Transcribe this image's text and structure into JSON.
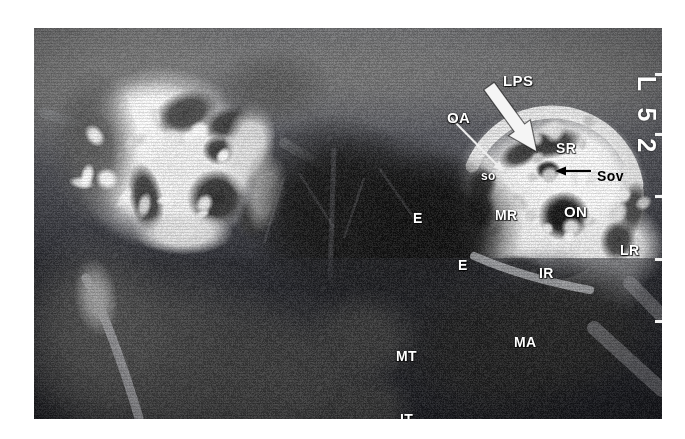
{
  "figure": {
    "modality": "MRI",
    "view": "coronal",
    "region": "orbits",
    "plate_left": 34,
    "plate_top": 28,
    "plate_width": 628,
    "plate_height": 391,
    "background": "#ffffff",
    "film_base_color": "#55565a"
  },
  "orientation_marker": {
    "text": "L 5 2",
    "rotation_deg": 90,
    "color": "#ffffff"
  },
  "edge_ticks": [
    {
      "y": 45
    },
    {
      "y": 105
    },
    {
      "y": 167
    },
    {
      "y": 230
    },
    {
      "y": 292
    }
  ],
  "labels": [
    {
      "id": "lps",
      "text": "LPS",
      "x": 469,
      "y": 45,
      "size": "lg",
      "tone": "light"
    },
    {
      "id": "oa",
      "text": "OA",
      "x": 413,
      "y": 82,
      "size": "lg",
      "tone": "light"
    },
    {
      "id": "so",
      "text": "so",
      "x": 447,
      "y": 142,
      "size": "sm",
      "tone": "light"
    },
    {
      "id": "sr",
      "text": "SR",
      "x": 522,
      "y": 113,
      "size": "md",
      "tone": "light"
    },
    {
      "id": "sov",
      "text": "Sov",
      "x": 563,
      "y": 141,
      "size": "md",
      "tone": "dark"
    },
    {
      "id": "on",
      "text": "ON",
      "x": 530,
      "y": 176,
      "size": "lg",
      "tone": "light"
    },
    {
      "id": "mr",
      "text": "MR",
      "x": 461,
      "y": 180,
      "size": "md",
      "tone": "light"
    },
    {
      "id": "lr",
      "text": "LR",
      "x": 586,
      "y": 215,
      "size": "md",
      "tone": "light"
    },
    {
      "id": "ir",
      "text": "IR",
      "x": 505,
      "y": 238,
      "size": "md",
      "tone": "light"
    },
    {
      "id": "e1",
      "text": "E",
      "x": 379,
      "y": 183,
      "size": "md",
      "tone": "light"
    },
    {
      "id": "e2",
      "text": "E",
      "x": 424,
      "y": 230,
      "size": "md",
      "tone": "light"
    },
    {
      "id": "ma",
      "text": "MA",
      "x": 480,
      "y": 307,
      "size": "md",
      "tone": "light"
    },
    {
      "id": "mt",
      "text": "MT",
      "x": 362,
      "y": 321,
      "size": "md",
      "tone": "light"
    },
    {
      "id": "it",
      "text": "IT",
      "x": 366,
      "y": 384,
      "size": "md",
      "tone": "light"
    }
  ],
  "arrows": [
    {
      "id": "lps-arrow",
      "style": "block",
      "color": "#f5f5f5",
      "from": {
        "x": 455,
        "y": 58
      },
      "to": {
        "x": 503,
        "y": 124
      }
    },
    {
      "id": "oa-arrow",
      "style": "thin",
      "color": "#ededed",
      "from": {
        "x": 415,
        "y": 88
      },
      "to": {
        "x": 470,
        "y": 144
      }
    },
    {
      "id": "sov-arrow",
      "style": "thin",
      "color": "#000000",
      "from": {
        "x": 557,
        "y": 143
      },
      "to": {
        "x": 521,
        "y": 143
      }
    }
  ],
  "legend_keys": [
    {
      "abbr": "LPS",
      "meaning": "levator palpebrae superioris"
    },
    {
      "abbr": "OA",
      "meaning": "ophthalmic artery"
    },
    {
      "abbr": "so",
      "meaning": "superior oblique"
    },
    {
      "abbr": "SR",
      "meaning": "superior rectus"
    },
    {
      "abbr": "Sov",
      "meaning": "superior ophthalmic vein"
    },
    {
      "abbr": "ON",
      "meaning": "optic nerve"
    },
    {
      "abbr": "MR",
      "meaning": "medial rectus"
    },
    {
      "abbr": "LR",
      "meaning": "lateral rectus"
    },
    {
      "abbr": "IR",
      "meaning": "inferior rectus"
    },
    {
      "abbr": "E",
      "meaning": "ethmoid sinus"
    },
    {
      "abbr": "MA",
      "meaning": "maxillary antrum"
    },
    {
      "abbr": "MT",
      "meaning": "middle turbinate"
    },
    {
      "abbr": "IT",
      "meaning": "inferior turbinate"
    }
  ]
}
